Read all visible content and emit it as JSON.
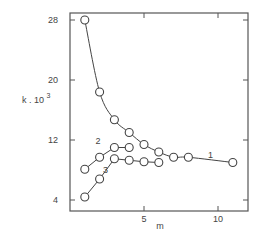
{
  "chart_data": {
    "type": "line",
    "title": "",
    "xlabel": "m",
    "ylabel": "k . 10^3",
    "ylabel_main": "k . 10",
    "ylabel_exp": "3",
    "xlim": [
      0,
      12
    ],
    "ylim": [
      3,
      29
    ],
    "xticks": [
      5,
      10
    ],
    "xtick_labels": [
      "5",
      "10"
    ],
    "yticks": [
      4,
      12,
      20,
      28
    ],
    "ytick_labels": [
      "4",
      "12",
      "20",
      "28"
    ],
    "grid": false,
    "legend": "inline labels",
    "series": [
      {
        "name": "1",
        "x": [
          1,
          2,
          3,
          4,
          5,
          6,
          7,
          8,
          11
        ],
        "values": [
          28,
          18.4,
          14.7,
          13.0,
          11.4,
          10.4,
          9.7,
          9.7,
          9.0
        ],
        "smooth": true
      },
      {
        "name": "2",
        "x": [
          1,
          2,
          3,
          4
        ],
        "values": [
          8.1,
          9.7,
          11.0,
          11.0
        ],
        "smooth": false
      },
      {
        "name": "3",
        "x": [
          1,
          2,
          3,
          4,
          5,
          6
        ],
        "values": [
          4.4,
          6.8,
          9.5,
          9.3,
          9.1,
          9.0
        ],
        "smooth": false
      }
    ],
    "series_label_positions": [
      {
        "name": "1",
        "x": 9.5,
        "y": 9.6
      },
      {
        "name": "2",
        "x": 1.9,
        "y": 11.5
      },
      {
        "name": "3",
        "x": 2.4,
        "y": 7.6
      }
    ]
  },
  "colors": {
    "axis": "#555555",
    "line": "#444444",
    "marker_fill": "#ffffff"
  }
}
